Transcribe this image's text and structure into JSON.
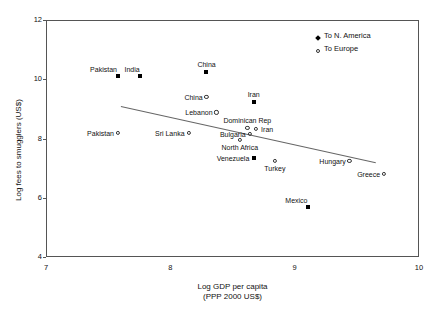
{
  "chart_data": {
    "type": "scatter",
    "title": "",
    "xlabel": "Log GDP per capita",
    "xlabel_line2": "(PPP 2000 US$)",
    "ylabel": "Log fees to smugglers (US$)",
    "xlim": [
      7,
      10
    ],
    "ylim": [
      4,
      12
    ],
    "xticks": [
      "7",
      "8",
      "9",
      "10"
    ],
    "yticks": [
      "4",
      "6",
      "8",
      "10",
      "12"
    ],
    "xtick_values": [
      7,
      8,
      9,
      10
    ],
    "ytick_values": [
      4,
      6,
      8,
      10,
      12
    ],
    "grid": false,
    "legend_position": "top-right",
    "legend": [
      {
        "label": "To N. America",
        "marker": "filled-diamond"
      },
      {
        "label": "To Europe",
        "marker": "open-circle"
      }
    ],
    "series": [
      {
        "name": "To N. America",
        "marker": "filled-diamond",
        "points": [
          {
            "label": "Pakistan",
            "x": 7.58,
            "y": 10.1,
            "label_pos": "above-left"
          },
          {
            "label": "India",
            "x": 7.76,
            "y": 10.1,
            "label_pos": "above-left"
          },
          {
            "label": "China",
            "x": 8.29,
            "y": 10.25,
            "label_pos": "above"
          },
          {
            "label": "Iran",
            "x": 8.67,
            "y": 9.22,
            "label_pos": "above"
          },
          {
            "label": "Venezuela",
            "x": 8.67,
            "y": 7.35,
            "label_pos": "left"
          },
          {
            "label": "Mexico",
            "x": 9.11,
            "y": 5.7,
            "label_pos": "above-left"
          }
        ]
      },
      {
        "name": "To Europe",
        "marker": "open-circle",
        "points": [
          {
            "label": "China",
            "x": 8.29,
            "y": 9.4,
            "label_pos": "left"
          },
          {
            "label": "Lebanon",
            "x": 8.37,
            "y": 8.88,
            "label_pos": "left"
          },
          {
            "label": "Pakistan",
            "x": 7.58,
            "y": 8.18,
            "label_pos": "left"
          },
          {
            "label": "Sri Lanka",
            "x": 8.15,
            "y": 8.18,
            "label_pos": "left"
          },
          {
            "label": "Dominican Rep",
            "x": 8.62,
            "y": 8.35,
            "label_pos": "above"
          },
          {
            "label": "Iran",
            "x": 8.69,
            "y": 8.32,
            "label_pos": "right"
          },
          {
            "label": "Bulgaria",
            "x": 8.64,
            "y": 8.16,
            "label_pos": "left"
          },
          {
            "label": "North Africa",
            "x": 8.56,
            "y": 7.95,
            "label_pos": "below"
          },
          {
            "label": "Turkey",
            "x": 8.84,
            "y": 7.25,
            "label_pos": "below"
          },
          {
            "label": "Hungary",
            "x": 9.44,
            "y": 7.25,
            "label_pos": "left"
          },
          {
            "label": "Greece",
            "x": 9.72,
            "y": 6.8,
            "label_pos": "left"
          }
        ]
      }
    ],
    "trendline": {
      "x0": 7.6,
      "y0": 9.1,
      "x1": 9.65,
      "y1": 7.2
    }
  }
}
